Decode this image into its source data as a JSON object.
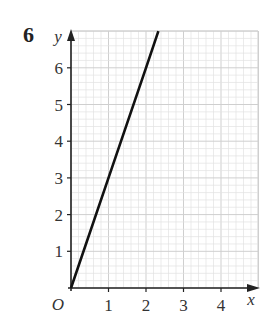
{
  "question_number": "6",
  "chart_data": {
    "type": "line",
    "title": "",
    "xlabel": "x",
    "ylabel": "y",
    "origin_label": "O",
    "xlim": [
      0,
      5
    ],
    "ylim": [
      0,
      7
    ],
    "x_ticks": [
      1,
      2,
      3,
      4
    ],
    "y_ticks": [
      1,
      2,
      3,
      4,
      5,
      6
    ],
    "grid": true,
    "grid_minor_step": 0.2,
    "series": [
      {
        "name": "y = 3x",
        "x": [
          0,
          1,
          2,
          2.33
        ],
        "y": [
          0,
          3,
          6,
          7
        ],
        "color": "#111111"
      }
    ]
  },
  "colors": {
    "grid_minor": "#e2e2e2",
    "grid_major": "#cfcfcf",
    "axis": "#222222",
    "line": "#111111",
    "text": "#333333"
  }
}
